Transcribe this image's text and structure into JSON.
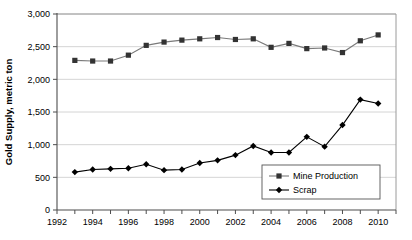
{
  "chart_data": {
    "type": "line",
    "title": "",
    "xlabel": "",
    "ylabel": "Gold Supply, metric ton",
    "x": [
      1993,
      1994,
      1995,
      1996,
      1997,
      1998,
      1999,
      2000,
      2001,
      2002,
      2003,
      2004,
      2005,
      2006,
      2007,
      2008,
      2009,
      2010
    ],
    "xlim": [
      1992,
      2011
    ],
    "ylim": [
      0,
      3000
    ],
    "xticks_major": [
      1992,
      1994,
      1996,
      1998,
      2000,
      2002,
      2004,
      2006,
      2008,
      2010
    ],
    "xticks_minor": [
      1993,
      1995,
      1997,
      1999,
      2001,
      2003,
      2005,
      2007,
      2009,
      2011
    ],
    "xtick_labels": [
      "1992",
      "1994",
      "1996",
      "1998",
      "2000",
      "2002",
      "2004",
      "2006",
      "2008",
      "2010"
    ],
    "yticks": [
      0,
      500,
      1000,
      1500,
      2000,
      2500,
      3000
    ],
    "ytick_labels": [
      "0",
      "500",
      "1,000",
      "1,500",
      "2,000",
      "2,500",
      "3,000"
    ],
    "grid": true,
    "legend_position": "bottom-right",
    "series": [
      {
        "name": "Mine Production",
        "color": "#7a7a7a",
        "marker": "square",
        "marker_color": "#333333",
        "values": [
          2290,
          2280,
          2280,
          2370,
          2520,
          2570,
          2600,
          2620,
          2640,
          2610,
          2620,
          2490,
          2550,
          2470,
          2480,
          2410,
          2590,
          2680
        ]
      },
      {
        "name": "Scrap",
        "color": "#000000",
        "marker": "diamond",
        "marker_color": "#000000",
        "values": [
          580,
          620,
          630,
          640,
          700,
          610,
          620,
          720,
          760,
          840,
          980,
          880,
          880,
          1120,
          970,
          1300,
          1690,
          1630
        ]
      }
    ]
  },
  "legend": {
    "items": [
      {
        "label": "Mine Production"
      },
      {
        "label": "Scrap"
      }
    ]
  }
}
